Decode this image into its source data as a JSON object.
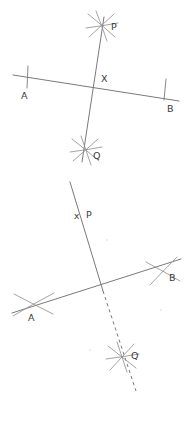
{
  "figure": {
    "background_color": "#ffffff",
    "line_color": "#6b6b6b",
    "arc_color": "#8d8d8d",
    "label_color": "#3a3a3a",
    "width": 191,
    "height": 423
  },
  "diagrams": [
    {
      "id": "top-diagram",
      "name": "perpendicular-bisector-construction",
      "description": "Line AB crossed at X by line PQ drawn through compass arc intersections P and Q",
      "labels": {
        "a": "A",
        "b": "B",
        "p": "P",
        "q": "Q",
        "x": "X"
      },
      "label_positions": {
        "a": {
          "x": 21,
          "y": 99
        },
        "b": {
          "x": 167,
          "y": 112
        },
        "p": {
          "x": 111,
          "y": 30
        },
        "q": {
          "x": 93,
          "y": 159
        },
        "x": {
          "x": 101,
          "y": 82
        }
      },
      "geometry": {
        "line_ab": {
          "x1": 13,
          "y1": 75,
          "x2": 179,
          "y2": 101
        },
        "line_pq": {
          "x1": 104,
          "y1": 17,
          "x2": 82,
          "y2": 162
        },
        "intersection_x": {
          "x": 96,
          "y": 88
        },
        "tick_a": {
          "x": 28,
          "y": 77
        },
        "tick_b": {
          "x": 165,
          "y": 89
        },
        "arc_center_p": {
          "x": 102,
          "y": 26
        },
        "arc_center_q": {
          "x": 86,
          "y": 150
        }
      }
    },
    {
      "id": "bottom-diagram",
      "name": "perpendicular-through-point-construction",
      "description": "Line AB with arcs at A and B; line from P through the foot continues as a dashed line toward Q",
      "labels": {
        "a": "A",
        "b": "B",
        "p": "P",
        "q": "Q",
        "x_tick": "x"
      },
      "label_positions": {
        "a": {
          "x": 28,
          "y": 321
        },
        "b": {
          "x": 169,
          "y": 281
        },
        "p": {
          "x": 86,
          "y": 218
        },
        "q": {
          "x": 131,
          "y": 359
        },
        "x_tick": {
          "x": 74,
          "y": 219
        }
      },
      "geometry": {
        "line_ab": {
          "x1": 12,
          "y1": 313,
          "x2": 181,
          "y2": 259
        },
        "line_p_solid": {
          "x1": 70,
          "y1": 182,
          "x2": 103,
          "y2": 291
        },
        "line_q_dashed": {
          "x1": 103,
          "y1": 291,
          "x2": 136,
          "y2": 391
        },
        "intersection_foot": {
          "x": 103,
          "y": 291
        },
        "arc_center_a": {
          "x": 33,
          "y": 304
        },
        "arc_center_b": {
          "x": 163,
          "y": 271
        },
        "arc_center_q": {
          "x": 122,
          "y": 357
        }
      }
    }
  ]
}
